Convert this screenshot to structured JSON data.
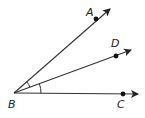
{
  "diagram": {
    "type": "angle-rays",
    "vertex": {
      "label": "B",
      "x": 14,
      "y": 93
    },
    "rays": [
      {
        "name": "BA",
        "point_label": "A",
        "point": [
          96,
          19
        ],
        "tip": [
          110,
          9
        ],
        "label_pos": [
          86,
          16
        ]
      },
      {
        "name": "BD",
        "point_label": "D",
        "point": [
          116,
          56
        ],
        "tip": [
          131,
          50
        ],
        "label_pos": [
          111,
          47
        ]
      },
      {
        "name": "BC",
        "point_label": "C",
        "point": [
          123,
          94
        ],
        "tip": [
          138,
          94
        ],
        "label_pos": [
          117,
          108
        ]
      }
    ],
    "vertex_label_pos": [
      8,
      108
    ],
    "angle_marks": [
      {
        "between": [
          "BA",
          "BD"
        ],
        "radius": 17
      },
      {
        "between": [
          "BD",
          "BC"
        ],
        "radius": 27
      }
    ],
    "colors": {
      "line": "#333333",
      "point": "#111111",
      "label": "#222222"
    }
  }
}
